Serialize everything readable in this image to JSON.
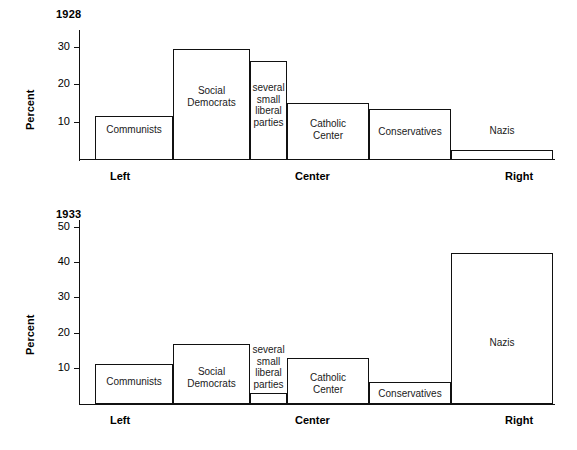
{
  "figure": {
    "title_1": "1928",
    "title_2": "1933",
    "axis_title": "Percent"
  },
  "chart_data": [
    {
      "type": "bar",
      "title": "1928",
      "xlabel": "",
      "ylabel": "Percent",
      "ylim": [
        0,
        33
      ],
      "yticks": [
        10,
        20,
        30
      ],
      "ytick_labels": [
        "10",
        "20",
        "30"
      ],
      "grid": false,
      "legend": "none",
      "categories": [
        "Communists",
        "Social Democrats",
        "several small liberal parties",
        "Catholic Center",
        "Conservatives",
        "Nazis"
      ],
      "bar_labels": [
        "Communists",
        "Social\nDemocrats",
        "several\nsmall\nliberal\nparties",
        "Catholic\nCenter",
        "Conservatives",
        "Nazis"
      ],
      "values": [
        11.6,
        29.0,
        26.5,
        15.0,
        13.5,
        2.6
      ],
      "widths_pct": [
        13.5,
        13.3,
        6.4,
        14.2,
        14.2,
        13.5
      ],
      "annotations": [
        "Left",
        "Center",
        "Right"
      ]
    },
    {
      "type": "bar",
      "title": "1933",
      "xlabel": "",
      "ylabel": "Percent",
      "ylim": [
        0,
        53
      ],
      "yticks": [
        10,
        20,
        30,
        40,
        50
      ],
      "ytick_labels": [
        "10",
        "20",
        "30",
        "40",
        "50"
      ],
      "grid": false,
      "legend": "none",
      "categories": [
        "Communists",
        "Social Democrats",
        "several small liberal parties",
        "Catholic Center",
        "Conservatives",
        "Nazis"
      ],
      "bar_labels": [
        "Communists",
        "Social\nDemocrats",
        "several\nsmall\nliberal\nparties",
        "Catholic\nCenter",
        "Conservatives",
        "Nazis"
      ],
      "values": [
        12.9,
        18.3,
        4.9,
        13.9,
        6.3,
        42.5
      ],
      "widths_pct": [
        13.5,
        13.3,
        6.4,
        14.2,
        14.2,
        13.5
      ],
      "annotations": [
        "Left",
        "Center",
        "Right"
      ]
    }
  ],
  "chart1": {
    "year": "1928",
    "axis_title": "Percent",
    "ticks": [
      {
        "label": "10",
        "y": 122
      },
      {
        "label": "20",
        "y": 84
      },
      {
        "label": "30",
        "y": 47
      }
    ],
    "bars": [
      {
        "label": "Communists",
        "x": 95,
        "w": 78,
        "top": 116,
        "text_y": 124
      },
      {
        "label": "Social\nDemocrats",
        "x": 173,
        "w": 77,
        "top": 49,
        "text_y": 85
      },
      {
        "label": "several\nsmall\nliberal\nparties",
        "x": 250,
        "w": 37,
        "top": 61,
        "text_y": 82
      },
      {
        "label": "Catholic\nCenter",
        "x": 287,
        "w": 82,
        "top": 103,
        "text_y": 118
      },
      {
        "label": "Conservatives",
        "x": 369,
        "w": 82,
        "top": 109,
        "text_y": 126
      },
      {
        "label": "Nazis",
        "x": 451,
        "w": 102,
        "top": 150,
        "text_y": 125
      }
    ],
    "groups": [
      {
        "label": "Left",
        "x": 110
      },
      {
        "label": "Center",
        "x": 295
      },
      {
        "label": "Right",
        "x": 505
      }
    ]
  },
  "chart2": {
    "year": "1933",
    "axis_title": "Percent",
    "ticks": [
      {
        "label": "10",
        "y": 368
      },
      {
        "label": "20",
        "y": 333
      },
      {
        "label": "30",
        "y": 297
      },
      {
        "label": "40",
        "y": 262
      },
      {
        "label": "50",
        "y": 227
      }
    ],
    "bars": [
      {
        "label": "Communists",
        "x": 95,
        "w": 78,
        "top": 364,
        "text_y": 376
      },
      {
        "label": "Social\nDemocrats",
        "x": 173,
        "w": 77,
        "top": 344,
        "text_y": 366
      },
      {
        "label": "several\nsmall\nliberal\nparties",
        "x": 250,
        "w": 37,
        "top": 393,
        "text_y": 344
      },
      {
        "label": "Catholic\nCenter",
        "x": 287,
        "w": 82,
        "top": 358,
        "text_y": 372
      },
      {
        "label": "Conservatives",
        "x": 369,
        "w": 82,
        "top": 382,
        "text_y": 388
      },
      {
        "label": "Nazis",
        "x": 451,
        "w": 102,
        "top": 253,
        "text_y": 337
      }
    ],
    "groups": [
      {
        "label": "Left",
        "x": 110
      },
      {
        "label": "Center",
        "x": 295
      },
      {
        "label": "Right",
        "x": 505
      }
    ]
  },
  "colors": {
    "ink": "#111111",
    "background": "#ffffff"
  }
}
